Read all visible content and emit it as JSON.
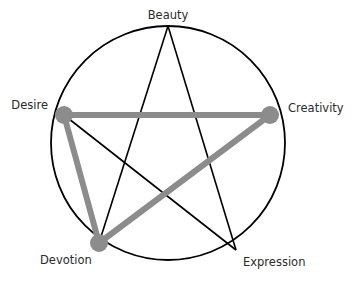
{
  "diagram": {
    "type": "pentagram-in-circle",
    "circle": {
      "cx": 168,
      "cy": 143,
      "r": 117,
      "stroke": "#000000"
    },
    "star_stroke": "#000000",
    "highlight_color": "#8c8c8c",
    "nodes": [
      {
        "id": "beauty",
        "label": "Beauty",
        "x": 168,
        "y": 26
      },
      {
        "id": "creativity",
        "label": "Creativity",
        "x": 270,
        "y": 115
      },
      {
        "id": "expression",
        "label": "Expression",
        "x": 236,
        "y": 250
      },
      {
        "id": "devotion",
        "label": "Devotion",
        "x": 99,
        "y": 243
      },
      {
        "id": "desire",
        "label": "Desire",
        "x": 64,
        "y": 115
      }
    ],
    "star_edges": [
      [
        "beauty",
        "expression"
      ],
      [
        "expression",
        "desire"
      ],
      [
        "desire",
        "creativity"
      ],
      [
        "creativity",
        "devotion"
      ],
      [
        "devotion",
        "beauty"
      ]
    ],
    "highlighted_triangle": [
      "desire",
      "creativity",
      "devotion"
    ],
    "highlighted_nodes": [
      "desire",
      "creativity",
      "devotion"
    ]
  },
  "labels": {
    "beauty": "Beauty",
    "creativity": "Creativity",
    "expression": "Expression",
    "devotion": "Devotion",
    "desire": "Desire"
  }
}
